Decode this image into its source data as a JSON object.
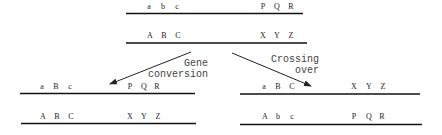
{
  "diagram": {
    "parent": {
      "chromosome_1": {
        "genes_left": [
          "a",
          "b",
          "c"
        ],
        "genes_right": [
          "P",
          "Q",
          "R"
        ]
      },
      "chromosome_2": {
        "genes_left": [
          "A",
          "B",
          "C"
        ],
        "genes_right": [
          "X",
          "Y",
          "Z"
        ]
      }
    },
    "gene_conversion": {
      "label_line1": "Gene",
      "label_line2": "conversion",
      "chromosome_1": {
        "genes_left": [
          "a",
          "B",
          "c"
        ],
        "genes_right": [
          "P",
          "Q",
          "R"
        ]
      },
      "chromosome_2": {
        "genes_left": [
          "A",
          "B",
          "C"
        ],
        "genes_right": [
          "X",
          "Y",
          "Z"
        ]
      }
    },
    "crossing_over": {
      "label_line1": "Crossing",
      "label_line2": "over",
      "chromosome_1": {
        "genes_left": [
          "a",
          "B",
          "C"
        ],
        "genes_right": [
          "X",
          "Y",
          "Z"
        ]
      },
      "chromosome_2": {
        "genes_left": [
          "A",
          "b",
          "c"
        ],
        "genes_right": [
          "P",
          "Q",
          "R"
        ]
      }
    }
  }
}
